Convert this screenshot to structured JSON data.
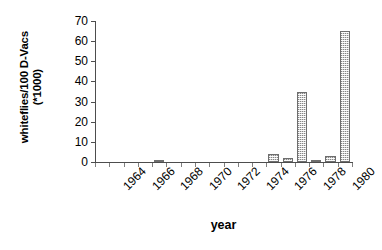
{
  "chart_data": {
    "type": "bar",
    "title": "",
    "xlabel": "year",
    "ylabel": "whiteflies/100 D-Vacs (*1000)",
    "ylabel_lines": [
      "whiteflies/100 D-Vacs",
      "(*1000)"
    ],
    "ylim": [
      0,
      70
    ],
    "ytick_labels": [
      "70",
      "60",
      "50",
      "40",
      "30",
      "20",
      "10",
      "0"
    ],
    "ytick_values": [
      70,
      60,
      50,
      40,
      30,
      20,
      10,
      0
    ],
    "grid": false,
    "legend": null,
    "bar_color": "#d4d4d4",
    "bar_edge_color": "#6e6e6e",
    "axis_color": "#4d4d4d",
    "categories": [
      "1964",
      "1965",
      "1966",
      "1967",
      "1968",
      "1969",
      "1970",
      "1971",
      "1972",
      "1973",
      "1974",
      "1975",
      "1976",
      "1977",
      "1978",
      "1979",
      "1980",
      "1981"
    ],
    "values": [
      0,
      0,
      0,
      0,
      1,
      0,
      0,
      0,
      0,
      0,
      0,
      0,
      4,
      2,
      35,
      1,
      3,
      4
    ],
    "last_bar_value": 65,
    "xtick_labels": [
      "1964",
      "1966",
      "1968",
      "1970",
      "1972",
      "1974",
      "1976",
      "1978",
      "1980"
    ],
    "xtick_categories": [
      "1964",
      "1966",
      "1968",
      "1970",
      "1972",
      "1974",
      "1976",
      "1978",
      "1980"
    ]
  }
}
